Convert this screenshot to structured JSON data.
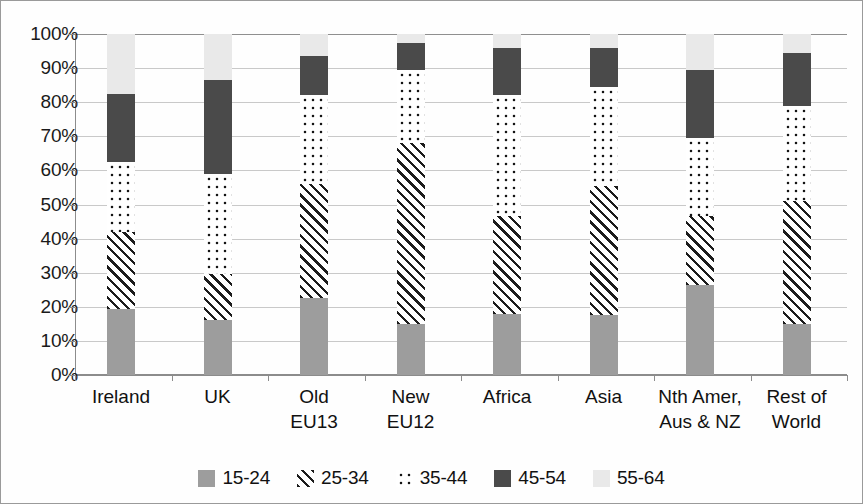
{
  "chart_data": {
    "type": "bar",
    "subtype": "stacked-100-percent",
    "title": "",
    "xlabel": "",
    "ylabel": "",
    "ylim": [
      0,
      100
    ],
    "ytick_labels": [
      "100%",
      "90%",
      "80%",
      "70%",
      "60%",
      "50%",
      "40%",
      "30%",
      "20%",
      "10%",
      "0%"
    ],
    "ytick_values": [
      100,
      90,
      80,
      70,
      60,
      50,
      40,
      30,
      20,
      10,
      0
    ],
    "grid": true,
    "legend_position": "bottom",
    "categories": [
      "Ireland",
      "UK",
      "Old\nEU13",
      "New\nEU12",
      "Africa",
      "Asia",
      "Nth Amer,\nAus & NZ",
      "Rest of\nWorld"
    ],
    "series": [
      {
        "name": "15-24",
        "pattern": "solid-grey",
        "color": "#9d9d9d",
        "values": [
          19.5,
          16.0,
          22.5,
          15.0,
          18.0,
          17.5,
          26.5,
          15.0
        ]
      },
      {
        "name": "25-34",
        "pattern": "diagonal-hatch",
        "color": "#1c1c1c",
        "values": [
          22.5,
          13.5,
          33.5,
          53.0,
          28.5,
          38.0,
          20.0,
          36.0
        ]
      },
      {
        "name": "35-44",
        "pattern": "dotted",
        "color": "#141414",
        "values": [
          20.5,
          29.5,
          26.0,
          21.5,
          35.5,
          29.0,
          23.0,
          28.0
        ]
      },
      {
        "name": "45-54",
        "pattern": "solid-dark",
        "color": "#4a4a4a",
        "values": [
          20.0,
          27.5,
          11.5,
          8.0,
          14.0,
          11.5,
          20.0,
          15.5
        ]
      },
      {
        "name": "55-64",
        "pattern": "solid-light",
        "color": "#e9e9e9",
        "values": [
          17.5,
          13.5,
          6.5,
          2.5,
          4.0,
          4.0,
          10.5,
          5.5
        ]
      }
    ],
    "cumulative_tops": [
      [
        19.5,
        42.0,
        62.5,
        82.5,
        100.0
      ],
      [
        16.0,
        29.5,
        59.0,
        86.5,
        100.0
      ],
      [
        22.5,
        56.0,
        82.0,
        93.5,
        100.0
      ],
      [
        15.0,
        68.0,
        89.5,
        97.5,
        100.0
      ],
      [
        18.0,
        46.5,
        82.0,
        96.0,
        100.0
      ],
      [
        17.5,
        55.5,
        84.5,
        96.0,
        100.0
      ],
      [
        26.5,
        46.5,
        69.5,
        89.5,
        100.0
      ],
      [
        15.0,
        51.0,
        79.0,
        94.5,
        100.0
      ]
    ]
  },
  "legend": {
    "items": [
      {
        "label": "15-24"
      },
      {
        "label": "25-34"
      },
      {
        "label": "35-44"
      },
      {
        "label": "45-54"
      },
      {
        "label": "55-64"
      }
    ]
  }
}
